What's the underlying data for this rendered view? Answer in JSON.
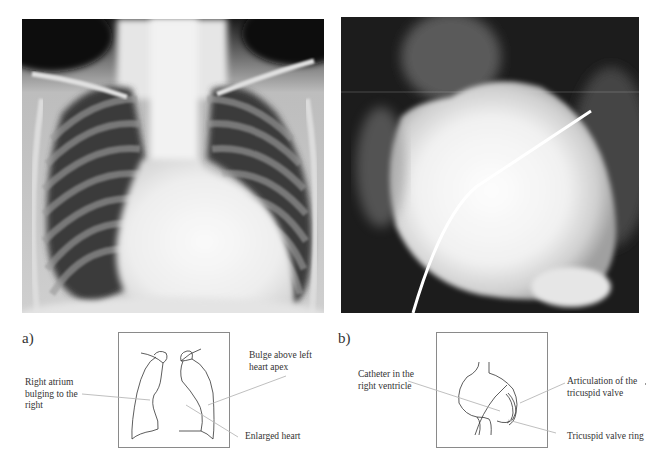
{
  "figure": {
    "panels": [
      {
        "letter": "a)",
        "image": "chest-xray-frontal",
        "labels": {
          "right_atrium": "Right atrium\nbulging to the\nright",
          "bulge_apex": "Bulge above left\nheart apex",
          "enlarged_heart": "Enlarged heart"
        }
      },
      {
        "letter": "b)",
        "image": "angiography-right-ventricle-catheter",
        "labels": {
          "catheter": "Catheter in the\nright ventricle",
          "articulation": "Articulation of the\ntricuspid valve",
          "valve_ring": "Tricuspid valve ring"
        }
      }
    ]
  },
  "colors": {
    "outline": "#333333",
    "leader_line": "#b8b8b8",
    "box_border": "#8a8a8a"
  }
}
